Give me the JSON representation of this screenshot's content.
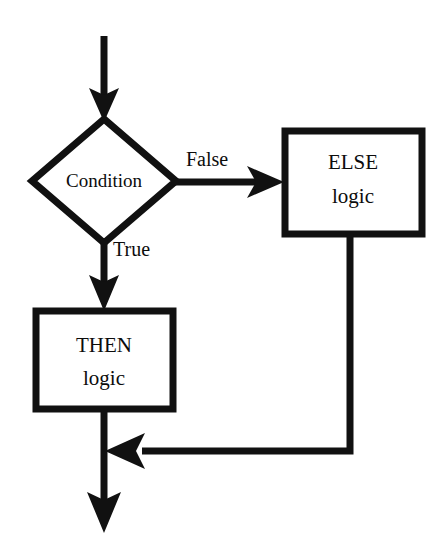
{
  "diagram": {
    "type": "flowchart",
    "background_color": "#ffffff",
    "stroke_color": "#111111",
    "text_color": "#0c0c0c",
    "nodes": [
      {
        "id": "condition",
        "shape": "diamond",
        "label": "Condition",
        "center": {
          "x": 104,
          "y": 181
        },
        "half_width": 72,
        "half_height": 62
      },
      {
        "id": "else_logic",
        "shape": "rectangle",
        "label_line1": "ELSE",
        "label_line2": "logic",
        "x": 282,
        "y": 128,
        "width": 142,
        "height": 108
      },
      {
        "id": "then_logic",
        "shape": "rectangle",
        "label_line1": "THEN",
        "label_line2": "logic",
        "x": 33,
        "y": 308,
        "width": 143,
        "height": 104
      }
    ],
    "edges": [
      {
        "id": "entry",
        "from": "start",
        "to": "condition",
        "label": "",
        "direction": "down"
      },
      {
        "id": "false_branch",
        "from": "condition",
        "to": "else_logic",
        "label": "False",
        "label_position": {
          "x": 186,
          "y": 161
        },
        "direction": "right"
      },
      {
        "id": "true_branch",
        "from": "condition",
        "to": "then_logic",
        "label": "True",
        "label_position": {
          "x": 113,
          "y": 251
        },
        "direction": "down"
      },
      {
        "id": "else_merge",
        "from": "else_logic",
        "to": "merge_point",
        "label": "",
        "direction": "down-left"
      },
      {
        "id": "exit",
        "from": "merge_point",
        "to": "end",
        "label": "",
        "direction": "down"
      }
    ]
  }
}
